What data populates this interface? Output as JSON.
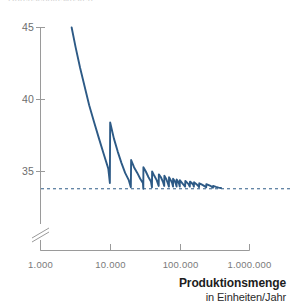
{
  "figure": {
    "clipped_header_text": "Durchschnittskosten",
    "background_color": "#ffffff"
  },
  "colors": {
    "curve": "#2d5a86",
    "asymptote": "#2d5a86",
    "axis": "#9a9a9a",
    "tick_label": "#707070",
    "title": "#1d1d1d"
  },
  "chart_data": {
    "type": "line",
    "title": "",
    "subtitle": "",
    "xlabel": "Produktionsmenge in Einheiten/Jahr",
    "xlabel_main": "Produktionsmenge",
    "xlabel_sub": "in Einheiten/Jahr",
    "ylabel": "",
    "x_scale": "log",
    "x_tick_labels": [
      "1.000",
      "10.000",
      "100.000",
      "1.000.000"
    ],
    "x_tick_values": [
      1000,
      10000,
      100000,
      1000000
    ],
    "xlim": [
      1000,
      1000000
    ],
    "y_tick_labels": [
      "45",
      "40",
      "35"
    ],
    "y_tick_values": [
      45,
      40,
      35
    ],
    "ylim": [
      33.0,
      45.2
    ],
    "y_axis_break": true,
    "grid": false,
    "legend": false,
    "annotations": [
      {
        "name": "asymptote",
        "type": "horizontal-dashed-line",
        "y_value": 33.8,
        "label": ""
      }
    ],
    "series": [
      {
        "name": "Durchschnittskosten",
        "color": "#2d5a86",
        "x": [
          2800,
          3200,
          3700,
          4300,
          5000,
          5900,
          6900,
          8100,
          9400,
          9900,
          10000,
          11300,
          12800,
          14500,
          16400,
          18500,
          19800,
          20000,
          22000,
          24500,
          27000,
          29500,
          29900,
          30000,
          32500,
          35500,
          38500,
          39800,
          40000,
          43000,
          46500,
          49700,
          50000,
          53500,
          57000,
          59700,
          60000,
          63500,
          67000,
          69700,
          70000,
          74000,
          77500,
          79800,
          80000,
          84000,
          87500,
          89800,
          90000,
          94000,
          97500,
          99800,
          100000,
          106000,
          112000,
          119000,
          120000,
          127000,
          134000,
          139000,
          140000,
          148000,
          156000,
          159000,
          160000,
          170000,
          180000,
          189000,
          190000,
          205000,
          220000,
          239000,
          240000,
          260000,
          280000,
          299000,
          300000,
          330000,
          360000,
          390000
        ],
        "y": [
          45.0,
          43.6,
          42.2,
          40.9,
          39.6,
          38.4,
          37.3,
          36.2,
          35.2,
          34.2,
          38.4,
          37.3,
          36.4,
          35.6,
          34.9,
          34.4,
          33.9,
          35.8,
          35.3,
          34.9,
          34.5,
          34.2,
          33.8,
          35.3,
          35.0,
          34.6,
          34.3,
          33.9,
          35.0,
          34.7,
          34.4,
          34.0,
          34.8,
          34.6,
          34.3,
          34.0,
          34.7,
          34.5,
          34.2,
          33.95,
          34.6,
          34.4,
          34.2,
          33.95,
          34.5,
          34.35,
          34.15,
          33.95,
          34.45,
          34.3,
          34.15,
          33.95,
          34.4,
          34.25,
          34.1,
          33.95,
          34.35,
          34.22,
          34.1,
          33.95,
          34.3,
          34.2,
          34.08,
          33.95,
          34.25,
          34.15,
          34.05,
          33.92,
          34.18,
          34.1,
          34.02,
          33.9,
          34.12,
          34.05,
          33.98,
          33.88,
          34.0,
          33.93,
          33.88,
          33.85
        ]
      }
    ]
  }
}
